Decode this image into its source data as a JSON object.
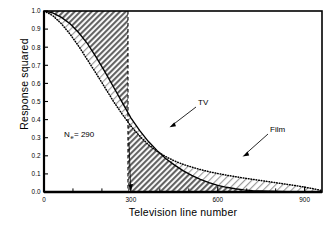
{
  "figure": {
    "title": "",
    "xlabel": "Television line number",
    "ylabel": "Response squared"
  },
  "annotations": {
    "tv_label": "TV",
    "film_label": "Film",
    "ne_symbol": "N",
    "ne_subscript": "e",
    "ne_value": " = 290"
  },
  "axis": {
    "x_ticklabels": [
      "0",
      "300",
      "600",
      "900"
    ],
    "y_ticklabels": [
      "0.0",
      "0.1",
      "0.2",
      "0.3",
      "0.4",
      "0.5",
      "0.6",
      "0.7",
      "0.8",
      "0.9",
      "1.0"
    ]
  },
  "colors": {
    "curve": "#000000",
    "frame": "#000000",
    "hatch_dark": "#6b6b6b",
    "hatch_light": "#b9b9b9",
    "background": "#ffffff"
  },
  "chart_data": {
    "type": "line",
    "title": "",
    "xlabel": "Television line number",
    "ylabel": "Response squared",
    "xlim": [
      0,
      960
    ],
    "ylim": [
      0.0,
      1.0
    ],
    "xticks": [
      0,
      300,
      600,
      900
    ],
    "xminor_ticks": [
      100,
      200,
      400,
      500,
      700,
      800
    ],
    "yticks": [
      0.0,
      0.1,
      0.2,
      0.3,
      0.4,
      0.5,
      0.6,
      0.7,
      0.8,
      0.9,
      1.0
    ],
    "grid": false,
    "legend": "none",
    "annotations": [
      {
        "text": "N_e = 290",
        "x": 160,
        "y": 0.28,
        "arrow_to": [
          290,
          0.0
        ]
      },
      {
        "text": "TV",
        "x": 440,
        "y": 0.48,
        "arrow_to": [
          355,
          0.345
        ]
      },
      {
        "text": "Film",
        "x": 690,
        "y": 0.345,
        "arrow_to": [
          600,
          0.165
        ]
      }
    ],
    "vline": {
      "x": 290,
      "style": "dashed",
      "label": "N_e = 290"
    },
    "shaded_regions": [
      {
        "name": "dark-above-tv-before-290",
        "hatch": "dark",
        "desc": "region between y=1.0 and TV curve for x in [0,290]"
      },
      {
        "name": "light-between-film-and-tv",
        "hatch": "light",
        "desc": "region between Film and TV curves"
      },
      {
        "name": "dark-under-curves-after-290",
        "hatch": "dark",
        "desc": "region under lower curve for x in [290,960]"
      }
    ],
    "series": [
      {
        "name": "TV",
        "style": "solid",
        "x": [
          0,
          30,
          60,
          90,
          120,
          150,
          180,
          210,
          240,
          270,
          300,
          330,
          360,
          390,
          420,
          450,
          480,
          510,
          540,
          570,
          600,
          630,
          660,
          690,
          720,
          780,
          840,
          900,
          960
        ],
        "y": [
          1.0,
          0.99,
          0.965,
          0.93,
          0.88,
          0.82,
          0.745,
          0.665,
          0.58,
          0.495,
          0.41,
          0.34,
          0.28,
          0.23,
          0.185,
          0.15,
          0.118,
          0.092,
          0.07,
          0.052,
          0.037,
          0.026,
          0.018,
          0.012,
          0.008,
          0.004,
          0.002,
          0.001,
          0.0
        ]
      },
      {
        "name": "Film",
        "style": "dotted",
        "x": [
          0,
          30,
          60,
          90,
          120,
          150,
          180,
          210,
          240,
          270,
          300,
          330,
          360,
          390,
          420,
          450,
          480,
          510,
          540,
          570,
          600,
          630,
          660,
          690,
          720,
          750,
          780,
          810,
          840,
          870,
          900,
          930,
          960
        ],
        "y": [
          1.0,
          0.975,
          0.93,
          0.872,
          0.805,
          0.73,
          0.655,
          0.578,
          0.5,
          0.43,
          0.365,
          0.31,
          0.262,
          0.225,
          0.196,
          0.172,
          0.153,
          0.138,
          0.124,
          0.112,
          0.102,
          0.093,
          0.085,
          0.077,
          0.07,
          0.063,
          0.056,
          0.049,
          0.042,
          0.035,
          0.027,
          0.018,
          0.008
        ]
      }
    ]
  }
}
